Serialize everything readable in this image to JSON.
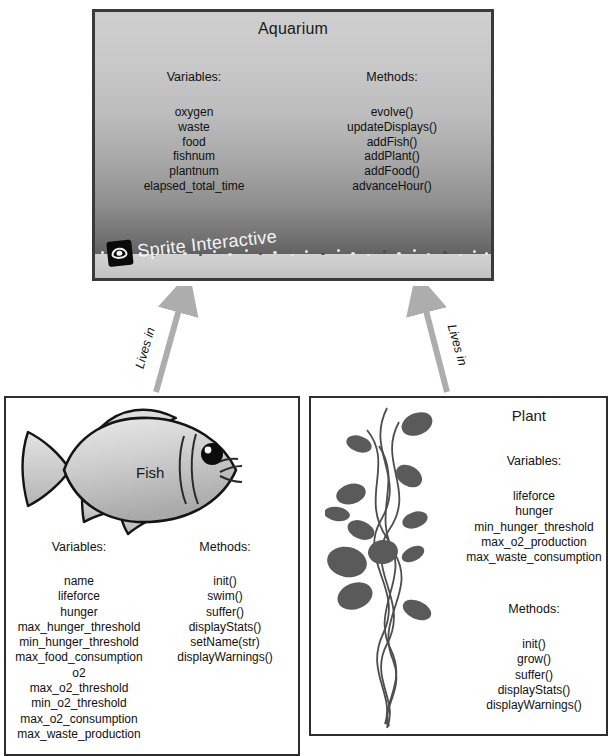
{
  "diagram": {
    "title_hidden": "",
    "aquarium": {
      "title": "Aquarium",
      "variables_heading": "Variables:",
      "methods_heading": "Methods:",
      "variables": [
        "oxygen",
        "waste",
        "food",
        "fishnum",
        "plantnum",
        "elapsed_total_time"
      ],
      "methods": [
        "evolve()",
        "updateDisplays()",
        "addFish()",
        "addPlant()",
        "addFood()",
        "advanceHour()"
      ],
      "watermark": "Sprite Interactive",
      "watermark_icon": "eye-icon"
    },
    "arrows": [
      {
        "label": "Lives in",
        "from": "fish",
        "to": "aquarium"
      },
      {
        "label": "Lives in",
        "from": "plant",
        "to": "aquarium"
      }
    ],
    "fish": {
      "title": "Fish",
      "variables_heading": "Variables:",
      "methods_heading": "Methods:",
      "variables": [
        "name",
        "lifeforce",
        "hunger",
        "max_hunger_threshold",
        "min_hunger_threshold",
        "max_food_consumption",
        "o2",
        "max_o2_threshold",
        "min_o2_threshold",
        "max_o2_consumption",
        "max_waste_production"
      ],
      "methods": [
        "init()",
        "swim()",
        "suffer()",
        "displayStats()",
        "setName(str)",
        "displayWarnings()"
      ]
    },
    "plant": {
      "title": "Plant",
      "variables_heading": "Variables:",
      "methods_heading": "Methods:",
      "variables": [
        "lifeforce",
        "hunger",
        "min_hunger_threshold",
        "max_o2_production",
        "max_waste_consumption"
      ],
      "methods": [
        "init()",
        "grow()",
        "suffer()",
        "displayStats()",
        "displayWarnings()"
      ]
    },
    "colors": {
      "border": "#2e2e2e",
      "water_top": "#cfcfcf",
      "water_bottom": "#545454",
      "gravel": "#cdcdcd",
      "arrow": "#a8a8a8",
      "leaf": "#5a5a5a",
      "fish_body": "#c8c8c8"
    }
  }
}
